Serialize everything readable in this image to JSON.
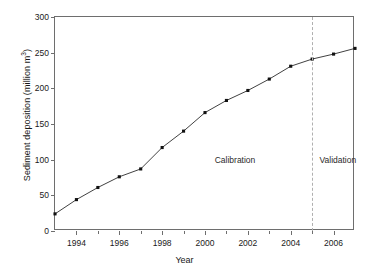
{
  "chart_data": {
    "type": "line",
    "title": "",
    "xlabel": "Year",
    "ylabel": "Sediment deposition (million m",
    "ylabel_sup": "3",
    "ylabel_tail": ")",
    "x": [
      1993,
      1994,
      1995,
      1996,
      1997,
      1998,
      1999,
      2000,
      2001,
      2002,
      2003,
      2004,
      2005,
      2006,
      2007
    ],
    "values": [
      24,
      44,
      61,
      76,
      87,
      117,
      140,
      166,
      183,
      197,
      213,
      231,
      241,
      248,
      256
    ],
    "series": [
      {
        "name": "Sediment deposition",
        "values": [
          24,
          44,
          61,
          76,
          87,
          117,
          140,
          166,
          183,
          197,
          213,
          231,
          241,
          248,
          256
        ]
      }
    ],
    "xlim": [
      1993,
      2007
    ],
    "ylim": [
      0,
      300
    ],
    "yticks": [
      0,
      50,
      100,
      150,
      200,
      250,
      300
    ],
    "ytick_labels": [
      "0",
      "50",
      "100",
      "150",
      "200",
      "250",
      "300"
    ],
    "xticks": [
      1994,
      1996,
      1998,
      2000,
      2002,
      2004,
      2006
    ],
    "xtick_labels": [
      "1994",
      "1996",
      "1998",
      "2000",
      "2002",
      "2004",
      "2006"
    ],
    "xticks_minor": [
      1993,
      1995,
      1997,
      1999,
      2001,
      2003,
      2005,
      2007
    ],
    "grid": false,
    "legend": "none",
    "marker": "filled-square",
    "line_color": "#2b2b2b",
    "marker_color": "#111111",
    "axis_color": "#6e6e6e",
    "annotations": [
      {
        "name": "calibration",
        "text": "Calibration",
        "x": 2001.4,
        "y": 98
      },
      {
        "name": "validation",
        "text": "Validation",
        "x": 2006.2,
        "y": 98
      }
    ],
    "split_line": {
      "x": 2005,
      "style": "dashed",
      "color": "#b0b0b0"
    }
  }
}
